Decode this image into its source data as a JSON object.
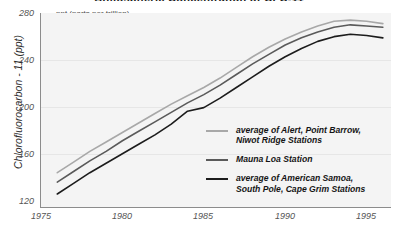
{
  "title": "Atmospheric Concentration of CFC-11",
  "units_caption": "ppt (parts per trillion)",
  "axes": {
    "ylabel": "Chlorofluorocarbon - 11 (ppt)",
    "yticks": [
      "280",
      "240",
      "200",
      "160",
      "120"
    ],
    "xticks": [
      "1975",
      "1980",
      "1985",
      "1990",
      "1995"
    ]
  },
  "legend": {
    "items": [
      {
        "label": "average of Alert, Point Barrow,\nNiwot Ridge Stations",
        "color": "#a8a8a8",
        "swatch": "legend-line-swatch"
      },
      {
        "label": "Mauna Loa Station",
        "color": "#5a5a5a",
        "swatch": "legend-line-swatch"
      },
      {
        "label": "average of American Samoa,\nSouth Pole, Cape Grim Stations",
        "color": "#1c1c1c",
        "swatch": "legend-line-swatch"
      }
    ]
  },
  "chart_data": {
    "type": "line",
    "title": "Atmospheric Concentration of CFC-11",
    "xlabel": "",
    "ylabel": "Chlorofluorocarbon - 11 (ppt)",
    "units": "ppt (parts per trillion)",
    "xlim": [
      1975,
      1996.5
    ],
    "ylim": [
      120,
      284
    ],
    "yticks": [
      120,
      160,
      200,
      240,
      280
    ],
    "xticks": [
      1975,
      1980,
      1985,
      1990,
      1995
    ],
    "grid": true,
    "legend_position": "inside-right-middle",
    "x": [
      1976,
      1977,
      1978,
      1979,
      1980,
      1981,
      1982,
      1983,
      1984,
      1985,
      1986,
      1987,
      1988,
      1989,
      1990,
      1991,
      1992,
      1993,
      1994,
      1995,
      1996
    ],
    "series": [
      {
        "name": "average of Alert, Point Barrow, Niwot Ridge Stations",
        "color": "#a8a8a8",
        "values": [
          149,
          158,
          167,
          175,
          183,
          191,
          199,
          207,
          214,
          221,
          229,
          238,
          247,
          255,
          262,
          268,
          273,
          277,
          278,
          277,
          275
        ]
      },
      {
        "name": "Mauna Loa Station",
        "color": "#5a5a5a",
        "values": [
          141,
          150,
          159,
          167,
          176,
          184,
          192,
          200,
          208,
          215,
          223,
          232,
          241,
          249,
          257,
          263,
          268,
          272,
          274,
          273,
          272
        ]
      },
      {
        "name": "average of American Samoa, South Pole, Cape Grim Stations",
        "color": "#1c1c1c",
        "values": [
          131,
          140,
          149,
          157,
          165,
          173,
          181,
          190,
          201,
          204,
          212,
          221,
          230,
          239,
          247,
          254,
          260,
          264,
          266,
          265,
          263
        ]
      }
    ]
  }
}
